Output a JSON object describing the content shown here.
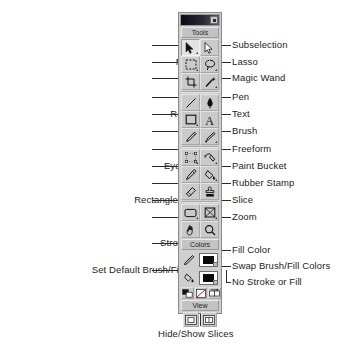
{
  "panel": {
    "close_label": "",
    "sections": {
      "tools": "Tools",
      "colors": "Colors",
      "view": "View"
    }
  },
  "labels_left": [
    {
      "text": "Pointer",
      "top": 44,
      "right": 218
    },
    {
      "text": "Marquee",
      "top": 61,
      "right": 218
    },
    {
      "text": "Crop",
      "top": 77,
      "right": 218
    },
    {
      "text": "Line",
      "top": 96,
      "right": 218
    },
    {
      "text": "Rectangle",
      "top": 113,
      "right": 218
    },
    {
      "text": "Pencil",
      "top": 130,
      "right": 218
    },
    {
      "text": "Scale",
      "top": 148,
      "right": 218
    },
    {
      "text": "Eyedropper",
      "top": 165,
      "right": 218
    },
    {
      "text": "Eraser",
      "top": 181,
      "right": 218
    },
    {
      "text": "Rectangle Hotspot",
      "top": 199,
      "right": 218
    },
    {
      "text": "Hand",
      "top": 216,
      "right": 218
    },
    {
      "text": "Stroke Color",
      "top": 241,
      "right": 218
    },
    {
      "text": "Set Default Brush/Fill Colors",
      "top": 268,
      "right": 218
    }
  ],
  "labels_right": [
    {
      "text": "Subselection",
      "top": 44,
      "left": 0
    },
    {
      "text": "Lasso",
      "top": 61,
      "left": 0
    },
    {
      "text": "Magic Wand",
      "top": 77,
      "left": 0
    },
    {
      "text": "Pen",
      "top": 96,
      "left": 0
    },
    {
      "text": "Text",
      "top": 113,
      "left": 0
    },
    {
      "text": "Brush",
      "top": 130,
      "left": 0
    },
    {
      "text": "Freeform",
      "top": 148,
      "left": 0
    },
    {
      "text": "Paint Bucket",
      "top": 165,
      "left": 0
    },
    {
      "text": "Rubber Stamp",
      "top": 181,
      "left": 0
    },
    {
      "text": "Slice",
      "top": 199,
      "left": 0
    },
    {
      "text": "Zoom",
      "top": 216,
      "left": 0
    },
    {
      "text": "Fill Color",
      "top": 249,
      "left": 0
    },
    {
      "text": "Swap Brush/Fill Colors",
      "top": 265,
      "left": 0
    },
    {
      "text": "No Stroke or Fill",
      "top": 281,
      "left": 0
    }
  ],
  "labels_bottom": [
    {
      "text": "Hide/Show Slices"
    }
  ],
  "tools": {
    "rows": [
      {
        "left": {
          "name": "pointer-tool",
          "icon": "arrow-pointer-icon",
          "selected": true,
          "menu": true
        },
        "right": {
          "name": "subselection-tool",
          "icon": "arrow-outline-icon",
          "selected": false,
          "menu": false
        }
      },
      {
        "left": {
          "name": "marquee-tool",
          "icon": "marquee-icon",
          "selected": false,
          "menu": true
        },
        "right": {
          "name": "lasso-tool",
          "icon": "lasso-icon",
          "selected": false,
          "menu": true
        }
      },
      {
        "left": {
          "name": "crop-tool",
          "icon": "crop-icon",
          "selected": false,
          "menu": false
        },
        "right": {
          "name": "magic-wand-tool",
          "icon": "magic-wand-icon",
          "selected": false,
          "menu": true
        }
      },
      {
        "left": {
          "name": "line-tool",
          "icon": "line-icon",
          "selected": false,
          "menu": false
        },
        "right": {
          "name": "pen-tool",
          "icon": "pen-nib-icon",
          "selected": false,
          "menu": false
        }
      },
      {
        "left": {
          "name": "rectangle-tool",
          "icon": "rectangle-icon",
          "selected": false,
          "menu": true
        },
        "right": {
          "name": "text-tool",
          "icon": "text-a-icon",
          "selected": false,
          "menu": false
        }
      },
      {
        "left": {
          "name": "pencil-tool",
          "icon": "pencil-icon",
          "selected": false,
          "menu": false
        },
        "right": {
          "name": "brush-tool",
          "icon": "brush-icon",
          "selected": false,
          "menu": true
        }
      },
      {
        "left": {
          "name": "scale-tool",
          "icon": "scale-icon",
          "selected": false,
          "menu": true
        },
        "right": {
          "name": "freeform-tool",
          "icon": "freeform-icon",
          "selected": false,
          "menu": true
        }
      },
      {
        "left": {
          "name": "eyedropper-tool",
          "icon": "eyedropper-icon",
          "selected": false,
          "menu": false
        },
        "right": {
          "name": "paint-bucket-tool",
          "icon": "paint-bucket-icon",
          "selected": false,
          "menu": true
        }
      },
      {
        "left": {
          "name": "eraser-tool",
          "icon": "eraser-icon",
          "selected": false,
          "menu": false
        },
        "right": {
          "name": "rubber-stamp-tool",
          "icon": "rubber-stamp-icon",
          "selected": false,
          "menu": false
        }
      },
      {
        "left": {
          "name": "rectangle-hotspot-tool",
          "icon": "hotspot-rect-icon",
          "selected": false,
          "menu": true
        },
        "right": {
          "name": "slice-tool",
          "icon": "slice-icon",
          "selected": false,
          "menu": true
        }
      },
      {
        "left": {
          "name": "hand-tool",
          "icon": "hand-icon",
          "selected": false,
          "menu": false
        },
        "right": {
          "name": "zoom-tool",
          "icon": "magnifier-icon",
          "selected": false,
          "menu": false
        }
      }
    ]
  },
  "colors": {
    "stroke": {
      "name": "stroke-color",
      "icon": "pencil-stroke-icon",
      "swatch": "#000000"
    },
    "fill": {
      "name": "fill-color",
      "icon": "paint-bucket-small-icon",
      "swatch": "#000000"
    },
    "buttons": [
      {
        "name": "set-default-brush-fill-colors",
        "icon": "default-colors-icon"
      },
      {
        "name": "no-stroke-or-fill",
        "icon": "no-stroke-fill-icon"
      },
      {
        "name": "swap-brush-fill-colors",
        "icon": "swap-colors-icon"
      }
    ]
  },
  "view": {
    "buttons": [
      {
        "name": "standard-screen-mode",
        "icon": "screen-standard-icon"
      },
      {
        "name": "hide-show-slices",
        "icon": "hide-show-slices-icon"
      }
    ]
  }
}
